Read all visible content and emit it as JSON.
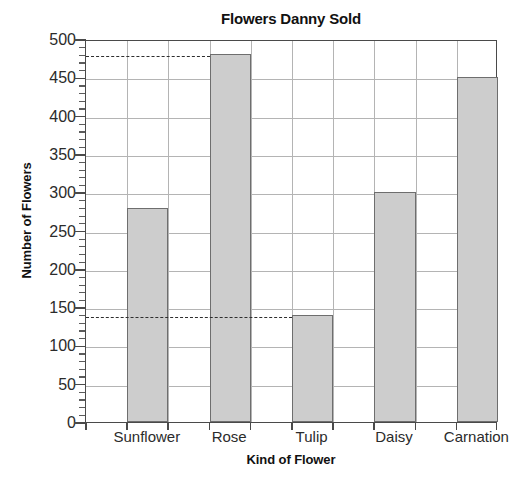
{
  "chart_data": {
    "type": "bar",
    "title": "Flowers Danny Sold",
    "xlabel": "Kind of Flower",
    "ylabel": "Number of Flowers",
    "categories": [
      "Sunflower",
      "Rose",
      "Tulip",
      "Daisy",
      "Carnation"
    ],
    "values": [
      280,
      480,
      140,
      300,
      450
    ],
    "ylim": [
      0,
      500
    ],
    "ytick_step": 50,
    "yticks": [
      0,
      50,
      100,
      150,
      200,
      250,
      300,
      350,
      400,
      450,
      500
    ],
    "ytick_labels": [
      "0",
      "50",
      "100",
      "150",
      "200",
      "250",
      "300",
      "350",
      "400",
      "450",
      "500"
    ],
    "minor_tick_step": 10,
    "grid": true,
    "legend": false,
    "bar_color": "#cdcdcd",
    "bar_border_color": "#6e6e6e",
    "grid_color": "#b4b4b4",
    "axis_color": "#4a4a4a",
    "annotations": [
      {
        "type": "dashed-guide",
        "value": 480,
        "from_category": "Rose",
        "to_axis": "y"
      },
      {
        "type": "dashed-guide",
        "value": 140,
        "from_category": "Tulip",
        "to_axis": "y"
      }
    ]
  }
}
